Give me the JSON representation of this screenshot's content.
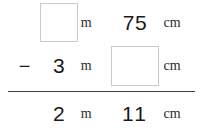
{
  "problem": {
    "type": "vertical-subtraction-length",
    "units": {
      "metre": "m",
      "centimetre": "cm"
    },
    "rows": [
      {
        "role": "minuend",
        "operator": "",
        "metre_value": "",
        "metre_is_box": true,
        "metre_unit": "m",
        "cm_value": "75",
        "cm_is_box": false,
        "cm_unit": "cm"
      },
      {
        "role": "subtrahend",
        "operator": "−",
        "metre_value": "3",
        "metre_is_box": false,
        "metre_unit": "m",
        "cm_value": "",
        "cm_is_box": true,
        "cm_unit": "cm"
      },
      {
        "role": "difference",
        "operator": "",
        "metre_value": "2",
        "metre_is_box": false,
        "metre_unit": "m",
        "cm_value": "11",
        "cm_is_box": false,
        "cm_unit": "cm"
      }
    ]
  },
  "colors": {
    "text": "#1a1a1a",
    "unit_text": "#2b2b2b",
    "box_border": "#c9c9c9",
    "rule": "#3d3d3d",
    "background": "#ffffff"
  }
}
